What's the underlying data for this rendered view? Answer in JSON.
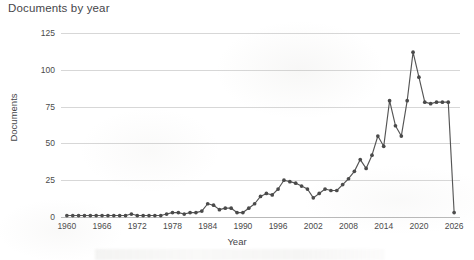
{
  "chart_data": {
    "type": "line",
    "title": "Documents by year",
    "xlabel": "Year",
    "ylabel": "Documents",
    "grid": "horizontal",
    "legend": "none",
    "xlim": [
      1959,
      2027
    ],
    "ylim": [
      0,
      125
    ],
    "ytick_labels": [
      "125",
      "100",
      "75",
      "50",
      "25",
      "0"
    ],
    "ytick_values": [
      125,
      100,
      75,
      50,
      25,
      0
    ],
    "xtick_labels": [
      "1960",
      "1966",
      "1972",
      "1978",
      "1984",
      "1990",
      "1996",
      "2002",
      "2008",
      "2014",
      "2020",
      "2026"
    ],
    "xtick_values": [
      1960,
      1966,
      1972,
      1978,
      1984,
      1990,
      1996,
      2002,
      2008,
      2014,
      2020,
      2026
    ],
    "line_color": "#555555",
    "marker_color": "#4a4a4a",
    "marker": "circle",
    "x": [
      1960,
      1961,
      1962,
      1963,
      1964,
      1965,
      1966,
      1967,
      1968,
      1969,
      1970,
      1971,
      1972,
      1973,
      1974,
      1975,
      1976,
      1977,
      1978,
      1979,
      1980,
      1981,
      1982,
      1983,
      1984,
      1985,
      1986,
      1987,
      1988,
      1989,
      1990,
      1991,
      1992,
      1993,
      1994,
      1995,
      1996,
      1997,
      1998,
      1999,
      2000,
      2001,
      2002,
      2003,
      2004,
      2005,
      2006,
      2007,
      2008,
      2009,
      2010,
      2011,
      2012,
      2013,
      2014,
      2015,
      2016,
      2017,
      2018,
      2019,
      2020,
      2021,
      2022,
      2023,
      2024,
      2025,
      2026
    ],
    "y": [
      1,
      1,
      1,
      1,
      1,
      1,
      1,
      1,
      1,
      1,
      1,
      2,
      1,
      1,
      1,
      1,
      1,
      2,
      3,
      3,
      2,
      3,
      3,
      4,
      9,
      8,
      5,
      6,
      6,
      3,
      3,
      6,
      9,
      14,
      16,
      15,
      19,
      25,
      24,
      23,
      21,
      19,
      13,
      16,
      19,
      18,
      18,
      22,
      26,
      31,
      39,
      33,
      42,
      55,
      48,
      79,
      62,
      55,
      79,
      112,
      95,
      78,
      77,
      78,
      78,
      78,
      3
    ],
    "values_note": "Documents per year; sharp peak 112 in 2019, final partial year 2026 drops to 3"
  },
  "chart": {
    "title": "Documents by year",
    "xlabel": "Year",
    "ylabel": "Documents"
  }
}
